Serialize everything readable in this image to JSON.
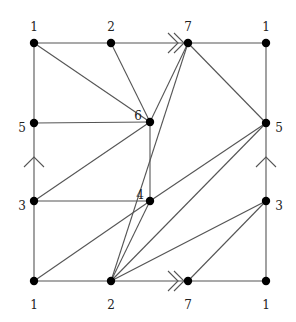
{
  "diagram": {
    "title": "",
    "type": "triangulated square with edge identifications",
    "colors": {
      "edge": "#555555",
      "vertex": "#000000",
      "label": "#222222"
    },
    "vertices": [
      {
        "id": "TL",
        "label": "1",
        "x": 34,
        "y": 43,
        "lx": 34,
        "ly": 27,
        "anchor": "middle"
      },
      {
        "id": "T2",
        "label": "2",
        "x": 111,
        "y": 43,
        "lx": 111,
        "ly": 27,
        "anchor": "middle"
      },
      {
        "id": "T7",
        "label": "7",
        "x": 188,
        "y": 43,
        "lx": 188,
        "ly": 27,
        "anchor": "middle"
      },
      {
        "id": "TR",
        "label": "1",
        "x": 266,
        "y": 43,
        "lx": 266,
        "ly": 27,
        "anchor": "middle"
      },
      {
        "id": "L5",
        "label": "5",
        "x": 34,
        "y": 123,
        "lx": 22,
        "ly": 128,
        "anchor": "middle"
      },
      {
        "id": "C6",
        "label": "6",
        "x": 150,
        "y": 122,
        "lx": 138,
        "ly": 116,
        "anchor": "middle"
      },
      {
        "id": "R5",
        "label": "5",
        "x": 266,
        "y": 123,
        "lx": 279,
        "ly": 128,
        "anchor": "middle"
      },
      {
        "id": "L3",
        "label": "3",
        "x": 34,
        "y": 201,
        "lx": 22,
        "ly": 206,
        "anchor": "middle"
      },
      {
        "id": "C4",
        "label": "4",
        "x": 150,
        "y": 201,
        "lx": 140,
        "ly": 195,
        "anchor": "middle"
      },
      {
        "id": "R3",
        "label": "3",
        "x": 266,
        "y": 201,
        "lx": 279,
        "ly": 206,
        "anchor": "middle"
      },
      {
        "id": "BL",
        "label": "1",
        "x": 34,
        "y": 281,
        "lx": 34,
        "ly": 305,
        "anchor": "middle"
      },
      {
        "id": "B2",
        "label": "2",
        "x": 111,
        "y": 281,
        "lx": 111,
        "ly": 305,
        "anchor": "middle"
      },
      {
        "id": "B7",
        "label": "7",
        "x": 188,
        "y": 281,
        "lx": 188,
        "ly": 305,
        "anchor": "middle"
      },
      {
        "id": "BR",
        "label": "1",
        "x": 266,
        "y": 281,
        "lx": 266,
        "ly": 305,
        "anchor": "middle"
      }
    ],
    "edges": [
      [
        "TL",
        "T2"
      ],
      [
        "T2",
        "T7"
      ],
      [
        "T7",
        "TR"
      ],
      [
        "BL",
        "B2"
      ],
      [
        "B2",
        "B7"
      ],
      [
        "B7",
        "BR"
      ],
      [
        "TL",
        "L5"
      ],
      [
        "L5",
        "L3"
      ],
      [
        "L3",
        "BL"
      ],
      [
        "TR",
        "R5"
      ],
      [
        "R5",
        "R3"
      ],
      [
        "R3",
        "BR"
      ],
      [
        "TL",
        "C6"
      ],
      [
        "T2",
        "C6"
      ],
      [
        "T7",
        "C6"
      ],
      [
        "L5",
        "C6"
      ],
      [
        "L3",
        "C6"
      ],
      [
        "C6",
        "C4"
      ],
      [
        "L3",
        "C4"
      ],
      [
        "BL",
        "C4"
      ],
      [
        "T7",
        "R5"
      ],
      [
        "T7",
        "B2"
      ],
      [
        "C4",
        "R5"
      ],
      [
        "C4",
        "B2"
      ],
      [
        "B2",
        "R5"
      ],
      [
        "B2",
        "R3"
      ],
      [
        "B7",
        "R3"
      ]
    ],
    "identification_arrows": [
      {
        "side": "top",
        "type": "double",
        "direction": "right",
        "x": 160,
        "y": 43
      },
      {
        "side": "bottom",
        "type": "double",
        "direction": "right",
        "x": 160,
        "y": 281
      },
      {
        "side": "left",
        "type": "single",
        "direction": "up",
        "x": 34,
        "y": 157
      },
      {
        "side": "right",
        "type": "single",
        "direction": "up",
        "x": 266,
        "y": 157
      }
    ]
  }
}
